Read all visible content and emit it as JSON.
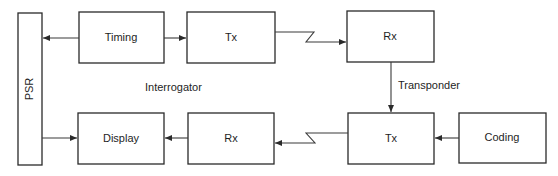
{
  "diagram": {
    "type": "block-diagram",
    "boxes": {
      "psr": {
        "label": "PSR"
      },
      "timing": {
        "label": "Timing"
      },
      "tx_interrogator": {
        "label": "Tx"
      },
      "rx_transponder": {
        "label": "Rx"
      },
      "display": {
        "label": "Display"
      },
      "rx_interrogator": {
        "label": "Rx"
      },
      "tx_transponder": {
        "label": "Tx"
      },
      "coding": {
        "label": "Coding"
      }
    },
    "group_labels": {
      "interrogator": "Interrogator",
      "transponder": "Transponder"
    },
    "connections": [
      {
        "from": "Timing",
        "to": "PSR",
        "kind": "arrow"
      },
      {
        "from": "Timing",
        "to": "Tx (interrogator)",
        "kind": "arrow"
      },
      {
        "from": "Tx (interrogator)",
        "to": "Rx (transponder)",
        "kind": "radio-link"
      },
      {
        "from": "Rx (transponder)",
        "to": "Tx (transponder)",
        "kind": "arrow"
      },
      {
        "from": "Coding",
        "to": "Tx (transponder)",
        "kind": "arrow"
      },
      {
        "from": "Tx (transponder)",
        "to": "Rx (interrogator)",
        "kind": "radio-link"
      },
      {
        "from": "Rx (interrogator)",
        "to": "Display",
        "kind": "arrow"
      },
      {
        "from": "PSR",
        "to": "Display",
        "kind": "arrow"
      }
    ]
  }
}
